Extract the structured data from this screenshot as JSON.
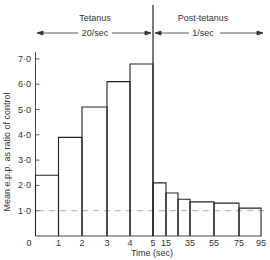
{
  "chart_data": {
    "type": "bar",
    "title": "",
    "xlabel": "Time (sec)",
    "ylabel": "Mean e.p.p. as ratio of control",
    "ylim": [
      0,
      7.3
    ],
    "yticks": [
      1.0,
      2.0,
      3.0,
      4.0,
      5.0,
      6.0,
      7.0
    ],
    "ytick_labels": [
      "1·0",
      "2·0",
      "3·0",
      "4·0",
      "5·0",
      "6·0",
      "7·0"
    ],
    "xtick_labels": [
      "0",
      "1",
      "2",
      "3",
      "4",
      "5",
      "15",
      "35",
      "55",
      "75",
      "95"
    ],
    "reference_line": {
      "y": 1.0,
      "style": "dashed"
    },
    "bins": [
      {
        "phase": "Tetanus",
        "start": 0,
        "end": 1,
        "value": 2.4
      },
      {
        "phase": "Tetanus",
        "start": 1,
        "end": 2,
        "value": 3.9
      },
      {
        "phase": "Tetanus",
        "start": 2,
        "end": 3,
        "value": 5.1
      },
      {
        "phase": "Tetanus",
        "start": 3,
        "end": 4,
        "value": 6.1
      },
      {
        "phase": "Tetanus",
        "start": 4,
        "end": 5,
        "value": 6.8
      },
      {
        "phase": "Post-tetanus",
        "start": 5,
        "end": 15,
        "value": 2.1
      },
      {
        "phase": "Post-tetanus",
        "start": 15,
        "end": 25,
        "value": 1.7
      },
      {
        "phase": "Post-tetanus",
        "start": 25,
        "end": 35,
        "value": 1.45
      },
      {
        "phase": "Post-tetanus",
        "start": 35,
        "end": 55,
        "value": 1.35
      },
      {
        "phase": "Post-tetanus",
        "start": 55,
        "end": 75,
        "value": 1.3
      },
      {
        "phase": "Post-tetanus",
        "start": 75,
        "end": 95,
        "value": 1.1
      }
    ],
    "annotations": [
      {
        "text": "Tetanus",
        "subtext": "20/sec",
        "span": [
          0,
          5
        ]
      },
      {
        "text": "Post-tetanus",
        "subtext": "1/sec",
        "span": [
          5,
          95
        ]
      }
    ],
    "grid": false,
    "legend": null
  },
  "header": {
    "tetanus_label": "Tetanus",
    "tetanus_rate": "20/sec",
    "post_label": "Post-tetanus",
    "post_rate": "1/sec"
  },
  "axes": {
    "xlabel": "Time (sec)",
    "ylabel": "Mean e.p.p. as ratio of control"
  }
}
